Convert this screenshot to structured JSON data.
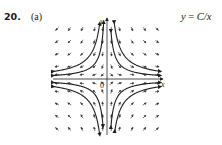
{
  "problem": {
    "number": "20.",
    "part": "(a)",
    "equation_lhs": "y",
    "equation_eq": " = ",
    "equation_rhs": "C/x"
  },
  "diagram": {
    "type": "direction_field",
    "differential_equation": "dy/dx = -y/x",
    "solution_family": "y = C/x",
    "axes": {
      "x_label": "x",
      "y_label": "y",
      "origin_label": "0"
    },
    "plot_box": {
      "left": 53,
      "top": 22,
      "right": 160,
      "bottom": 135
    },
    "origin_px": {
      "x": 107,
      "y": 79
    },
    "grid": {
      "cols": [
        -4,
        -3,
        -2,
        -1,
        -0.35,
        0.35,
        1,
        2,
        3,
        4
      ],
      "rows": [
        -4,
        -3,
        -2,
        -1,
        -0.35,
        0.35,
        1,
        2,
        3,
        4
      ],
      "scale": 12.5
    },
    "solution_curves_C": [
      1.2,
      2.6,
      -1.2,
      -2.6
    ],
    "colors": {
      "arrow": "#3a3a3a",
      "curve": "#1e1e1e",
      "axis": "#222222",
      "text": "#1a1a1a"
    }
  }
}
